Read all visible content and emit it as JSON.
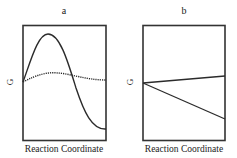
{
  "panels": [
    {
      "label": "a",
      "ylabel": "G",
      "xlabel": "Reaction Coordinate",
      "curves": [
        {
          "name": "solid-curve",
          "style": "solid",
          "description": "rises to a high maximum then falls well below start"
        },
        {
          "name": "dotted-curve",
          "style": "dotted",
          "description": "nearly flat with a slight broad maximum"
        }
      ]
    },
    {
      "label": "b",
      "ylabel": "G",
      "xlabel": "Reaction Coordinate",
      "curves": [
        {
          "name": "solid-line-upper",
          "style": "solid",
          "description": "slightly rising straight line"
        },
        {
          "name": "solid-line-lower",
          "style": "solid",
          "description": "steeply descending straight line"
        }
      ]
    }
  ],
  "colors": {
    "line": "#2b2b2b",
    "frame": "#333333",
    "background": "#ffffff"
  }
}
